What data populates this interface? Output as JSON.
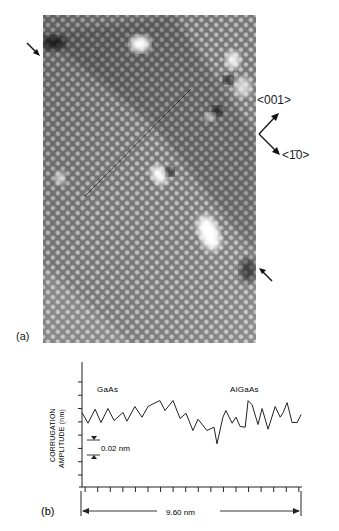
{
  "panel_a": {
    "label": "(a)",
    "direction_labels": {
      "upper": "<001>",
      "lower": "<1̄0>"
    },
    "arrows": [
      "interface-marker-arrow-upper-left",
      "interface-marker-arrow-lower-right"
    ],
    "colors": {
      "background_gray": "#8a8a8a",
      "atom_light": "#d8d8d8",
      "atom_dark": "#5a5a5a",
      "bright_spot": "#ffffff",
      "line": "#222222"
    }
  },
  "panel_b": {
    "label": "(b)",
    "scale_bar_label": "9.60 nm",
    "amplitude_scale_label": "0.02 nm"
  },
  "chart_data": {
    "type": "line",
    "title": "",
    "xlabel": "9.60 nm",
    "ylabel": "CORRUGATION AMPLITUDE (nm)",
    "ylabel_lines": [
      "CORRUGATION",
      "AMPLITUDE (nm)"
    ],
    "annotations": [
      "GaAs",
      "AlGaAs",
      "0.02 nm"
    ],
    "xlim": [
      0,
      9.6
    ],
    "ylim": [
      -0.078,
      0.11
    ],
    "x_tick_count": 18,
    "y_tick_step": 0.02,
    "grid": false,
    "series": [
      {
        "name": "corrugation profile",
        "x": [
          0.0,
          0.26,
          0.57,
          0.83,
          1.13,
          1.4,
          1.79,
          1.96,
          2.31,
          2.62,
          2.88,
          3.1,
          3.4,
          3.62,
          3.97,
          4.28,
          4.54,
          4.84,
          5.06,
          5.45,
          5.76,
          5.89,
          6.15,
          6.28,
          6.55,
          6.72,
          6.9,
          7.12,
          7.25,
          7.42,
          7.68,
          7.86,
          8.12,
          8.43,
          8.65,
          8.78,
          8.95,
          9.17,
          9.39,
          9.56
        ],
        "values": [
          0.034,
          0.018,
          0.039,
          0.019,
          0.04,
          0.022,
          0.034,
          0.021,
          0.043,
          0.027,
          0.043,
          0.047,
          0.052,
          0.037,
          0.052,
          0.025,
          0.033,
          0.007,
          0.024,
          0.007,
          0.012,
          -0.013,
          0.027,
          0.037,
          0.018,
          0.027,
          0.013,
          0.012,
          0.052,
          0.046,
          0.016,
          0.04,
          0.009,
          0.043,
          0.027,
          0.034,
          0.049,
          0.019,
          0.019,
          0.031
        ]
      }
    ]
  }
}
